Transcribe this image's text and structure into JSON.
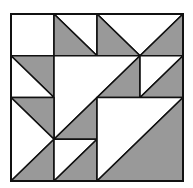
{
  "diagram": {
    "grid_units": 4,
    "colors": {
      "dark": "#999999",
      "light": "#ffffff",
      "line": "#111111"
    },
    "pieces": [
      {
        "name": "square-top-left",
        "fill": "light",
        "points": [
          [
            0,
            0
          ],
          [
            1,
            0
          ],
          [
            1,
            1
          ],
          [
            0,
            1
          ]
        ]
      },
      {
        "name": "tri-r0c1-light",
        "fill": "light",
        "points": [
          [
            1,
            0
          ],
          [
            2,
            0
          ],
          [
            2,
            1
          ]
        ]
      },
      {
        "name": "tri-r0c1-dark",
        "fill": "dark",
        "points": [
          [
            1,
            0
          ],
          [
            1,
            1
          ],
          [
            2,
            1
          ]
        ]
      },
      {
        "name": "top-right-light",
        "fill": "light",
        "points": [
          [
            2,
            0
          ],
          [
            4,
            0
          ],
          [
            3,
            1
          ]
        ]
      },
      {
        "name": "tri-r0c2-dark",
        "fill": "dark",
        "points": [
          [
            2,
            0
          ],
          [
            2,
            1
          ],
          [
            3,
            1
          ]
        ]
      },
      {
        "name": "tri-r0c3-dark",
        "fill": "dark",
        "points": [
          [
            3,
            1
          ],
          [
            4,
            0
          ],
          [
            4,
            1
          ]
        ]
      },
      {
        "name": "tri-r1c0-dark",
        "fill": "dark",
        "points": [
          [
            0,
            1
          ],
          [
            1,
            1
          ],
          [
            1,
            2
          ]
        ]
      },
      {
        "name": "tri-r1c0-light",
        "fill": "light",
        "points": [
          [
            0,
            1
          ],
          [
            0,
            2
          ],
          [
            1,
            2
          ]
        ]
      },
      {
        "name": "center-large-light",
        "fill": "light",
        "points": [
          [
            1,
            1
          ],
          [
            3,
            1
          ],
          [
            1,
            3
          ]
        ]
      },
      {
        "name": "center-dark-upper",
        "fill": "dark",
        "points": [
          [
            3,
            1
          ],
          [
            3,
            2
          ],
          [
            2,
            2
          ]
        ]
      },
      {
        "name": "center-dark-lower",
        "fill": "dark",
        "points": [
          [
            2,
            2
          ],
          [
            2,
            3
          ],
          [
            1,
            3
          ]
        ]
      },
      {
        "name": "tri-r1c3-light",
        "fill": "light",
        "points": [
          [
            3,
            1
          ],
          [
            4,
            1
          ],
          [
            3,
            2
          ]
        ]
      },
      {
        "name": "tri-r1c3-dark",
        "fill": "dark",
        "points": [
          [
            4,
            1
          ],
          [
            4,
            2
          ],
          [
            3,
            2
          ]
        ]
      },
      {
        "name": "tri-r2c0-dark",
        "fill": "dark",
        "points": [
          [
            0,
            2
          ],
          [
            1,
            2
          ],
          [
            1,
            3
          ]
        ]
      },
      {
        "name": "left-lower-light",
        "fill": "light",
        "points": [
          [
            0,
            2
          ],
          [
            1,
            3
          ],
          [
            0,
            4
          ]
        ]
      },
      {
        "name": "tri-r3c0-dark",
        "fill": "dark",
        "points": [
          [
            0,
            4
          ],
          [
            1,
            3
          ],
          [
            1,
            4
          ]
        ]
      },
      {
        "name": "tri-r3c1-light",
        "fill": "light",
        "points": [
          [
            1,
            3
          ],
          [
            2,
            3
          ],
          [
            1,
            4
          ]
        ]
      },
      {
        "name": "tri-r3c1-dark",
        "fill": "dark",
        "points": [
          [
            1,
            4
          ],
          [
            2,
            3
          ],
          [
            2,
            4
          ]
        ]
      },
      {
        "name": "bottom-right-light",
        "fill": "light",
        "points": [
          [
            2,
            2
          ],
          [
            4,
            2
          ],
          [
            2,
            4
          ]
        ]
      },
      {
        "name": "bottom-right-dark",
        "fill": "dark",
        "points": [
          [
            4,
            2
          ],
          [
            4,
            4
          ],
          [
            2,
            4
          ]
        ]
      }
    ]
  }
}
